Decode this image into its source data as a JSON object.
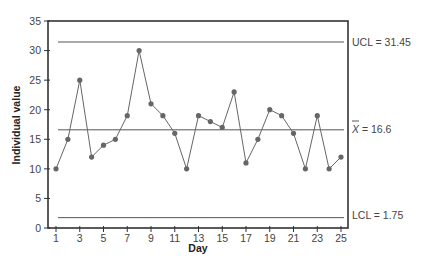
{
  "chart_data": {
    "type": "line",
    "title": "",
    "xlabel": "Day",
    "ylabel": "Individual value",
    "x": [
      1,
      2,
      3,
      4,
      5,
      6,
      7,
      8,
      9,
      10,
      11,
      12,
      13,
      14,
      15,
      16,
      17,
      18,
      19,
      20,
      21,
      22,
      23,
      24,
      25
    ],
    "series": [
      {
        "name": "Individual value",
        "values": [
          10,
          15,
          25,
          12,
          14,
          15,
          19,
          30,
          21,
          19,
          16,
          10,
          19,
          18,
          17,
          23,
          11,
          15,
          20,
          19,
          16,
          10,
          19,
          10,
          12
        ]
      }
    ],
    "xticks": [
      1,
      3,
      5,
      7,
      9,
      11,
      13,
      15,
      17,
      19,
      21,
      23,
      25
    ],
    "yticks": [
      0,
      5,
      10,
      15,
      20,
      25,
      30,
      35
    ],
    "xlim": [
      0.4,
      25.6
    ],
    "ylim": [
      0,
      35
    ],
    "grid": false,
    "reference_lines": [
      {
        "name": "UCL",
        "value": 31.45,
        "label": "UCL = 31.45"
      },
      {
        "name": "Mean",
        "value": 16.6,
        "label": "X̄ = 16.6"
      },
      {
        "name": "LCL",
        "value": 1.75,
        "label": "LCL = 1.75"
      }
    ]
  },
  "labels": {
    "xlabel": "Day",
    "ylabel": "Individual value",
    "ucl": "UCL = 31.45",
    "mean_symbol": "X",
    "mean_value": " = 16.6",
    "lcl": "LCL = 1.75"
  }
}
